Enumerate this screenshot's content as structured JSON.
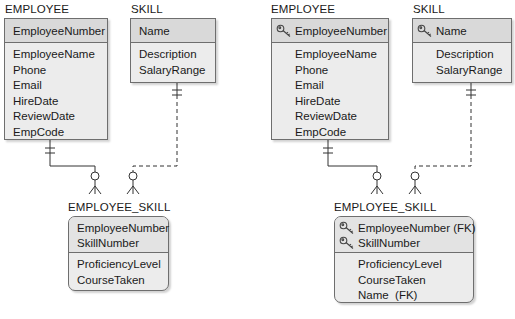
{
  "left_diagram": {
    "employee": {
      "title": "EMPLOYEE",
      "key_attributes": [
        "EmployeeNumber"
      ],
      "attributes": [
        "EmployeeName",
        "Phone",
        "Email",
        "HireDate",
        "ReviewDate",
        "EmpCode"
      ]
    },
    "skill": {
      "title": "SKILL",
      "key_attributes": [
        "Name"
      ],
      "attributes": [
        "Description",
        "SalaryRange"
      ]
    },
    "employee_skill": {
      "title": "EMPLOYEE_SKILL",
      "key_attributes": [
        "EmployeeNumber",
        "SkillNumber"
      ],
      "attributes": [
        "ProficiencyLevel",
        "CourseTaken"
      ]
    }
  },
  "right_diagram": {
    "employee": {
      "title": "EMPLOYEE",
      "key_attributes": [
        "EmployeeNumber"
      ],
      "attributes": [
        "EmployeeName",
        "Phone",
        "Email",
        "HireDate",
        "ReviewDate",
        "EmpCode"
      ]
    },
    "skill": {
      "title": "SKILL",
      "key_attributes": [
        "Name"
      ],
      "attributes": [
        "Description",
        "SalaryRange"
      ]
    },
    "employee_skill": {
      "title": "EMPLOYEE_SKILL",
      "key_attributes": [
        "EmployeeNumber (FK)",
        "SkillNumber"
      ],
      "attributes": [
        "ProficiencyLevel",
        "CourseTaken",
        "Name  (FK)"
      ]
    }
  },
  "icons": {
    "key": "key-icon"
  },
  "colors": {
    "header_fill": "#d9d9d9",
    "body_fill": "#ececec",
    "border": "#6e6e6e",
    "line": "#333333"
  }
}
